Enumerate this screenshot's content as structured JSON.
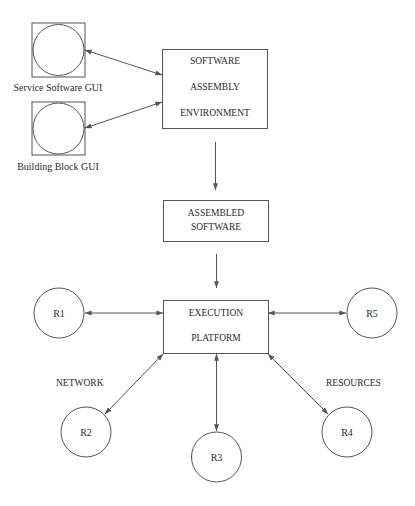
{
  "diagram": {
    "title": "",
    "gui": {
      "service_software": {
        "label": "Service Software GUI"
      },
      "building_block": {
        "label": "Building Block GUI"
      }
    },
    "boxes": {
      "assembly_env": {
        "line1": "SOFTWARE",
        "line2": "ASSEMBLY",
        "line3": "ENVIRONMENT"
      },
      "assembled_software": {
        "line1": "ASSEMBLED",
        "line2": "SOFTWARE"
      },
      "execution_platform": {
        "line1": "EXECUTION",
        "line2": "PLATFORM"
      }
    },
    "resources": {
      "r1": "R1",
      "r2": "R2",
      "r3": "R3",
      "r4": "R4",
      "r5": "R5"
    },
    "annotations": {
      "network": "NETWORK",
      "resources": "RESOURCES"
    },
    "edges": [
      {
        "from": "Service Software GUI",
        "to": "SOFTWARE ASSEMBLY ENVIRONMENT",
        "direction": "bidirectional"
      },
      {
        "from": "Building Block GUI",
        "to": "SOFTWARE ASSEMBLY ENVIRONMENT",
        "direction": "bidirectional"
      },
      {
        "from": "SOFTWARE ASSEMBLY ENVIRONMENT",
        "to": "ASSEMBLED SOFTWARE",
        "direction": "forward"
      },
      {
        "from": "ASSEMBLED SOFTWARE",
        "to": "EXECUTION PLATFORM",
        "direction": "forward"
      },
      {
        "from": "EXECUTION PLATFORM",
        "to": "R1",
        "direction": "bidirectional"
      },
      {
        "from": "EXECUTION PLATFORM",
        "to": "R2",
        "direction": "bidirectional"
      },
      {
        "from": "EXECUTION PLATFORM",
        "to": "R3",
        "direction": "bidirectional"
      },
      {
        "from": "EXECUTION PLATFORM",
        "to": "R4",
        "direction": "bidirectional"
      },
      {
        "from": "EXECUTION PLATFORM",
        "to": "R5",
        "direction": "bidirectional"
      }
    ],
    "colors": {
      "stroke": "#555555",
      "text": "#2a2a2a",
      "background": "#ffffff"
    }
  }
}
